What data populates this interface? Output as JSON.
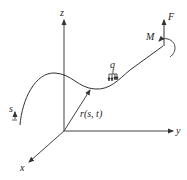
{
  "diagram": {
    "type": "3d-rod-coordinate-diagram",
    "colors": {
      "stroke": "#333333",
      "text": "#222222",
      "background": "#ffffff"
    },
    "axes": {
      "x": {
        "label": "x"
      },
      "y": {
        "label": "y"
      },
      "z": {
        "label": "z"
      }
    },
    "position_vector": {
      "label": "r(s, t)"
    },
    "arc_length": {
      "label": "s"
    },
    "distributed_load": {
      "label": "q"
    },
    "end_force": {
      "label": "F"
    },
    "end_moment": {
      "label": "M"
    }
  }
}
